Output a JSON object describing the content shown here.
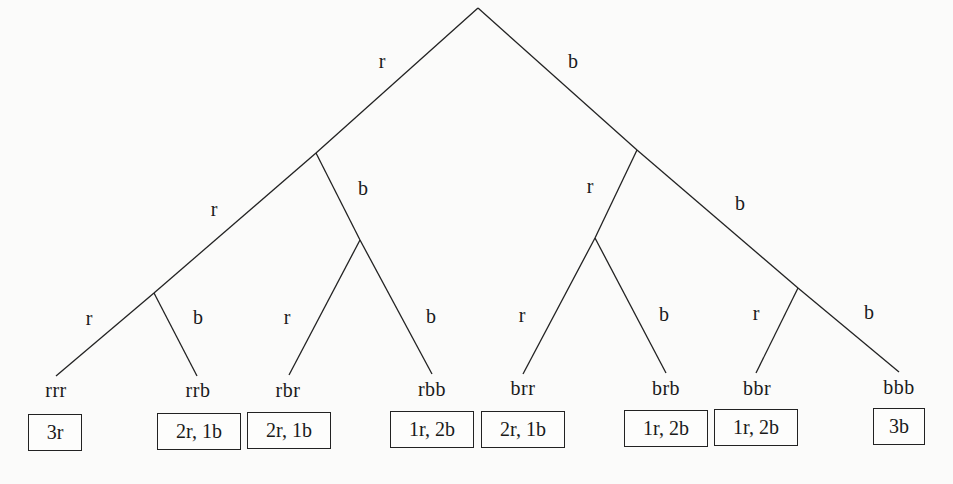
{
  "diagram": {
    "type": "probability-tree",
    "levels": 3,
    "branch_labels": {
      "root_left": "r",
      "root_right": "b",
      "r_left": "r",
      "r_right": "b",
      "b_left": "r",
      "b_right": "b",
      "rr_left": "r",
      "rr_right": "b",
      "rb_left": "r",
      "rb_right": "b",
      "br_left": "r",
      "br_right": "b",
      "bb_left": "r",
      "bb_right": "b"
    },
    "leaves": [
      {
        "sequence": "rrr",
        "outcome": "3r"
      },
      {
        "sequence": "rrb",
        "outcome": "2r, 1b"
      },
      {
        "sequence": "rbr",
        "outcome": "2r, 1b"
      },
      {
        "sequence": "rbb",
        "outcome": "1r, 2b"
      },
      {
        "sequence": "brr",
        "outcome": "2r, 1b"
      },
      {
        "sequence": "brb",
        "outcome": "1r, 2b"
      },
      {
        "sequence": "bbr",
        "outcome": "1r, 2b"
      },
      {
        "sequence": "bbb",
        "outcome": "3b"
      }
    ],
    "colors": {
      "line": "#222222",
      "text": "#1a1a1a",
      "background": "#fbfbfa"
    }
  }
}
